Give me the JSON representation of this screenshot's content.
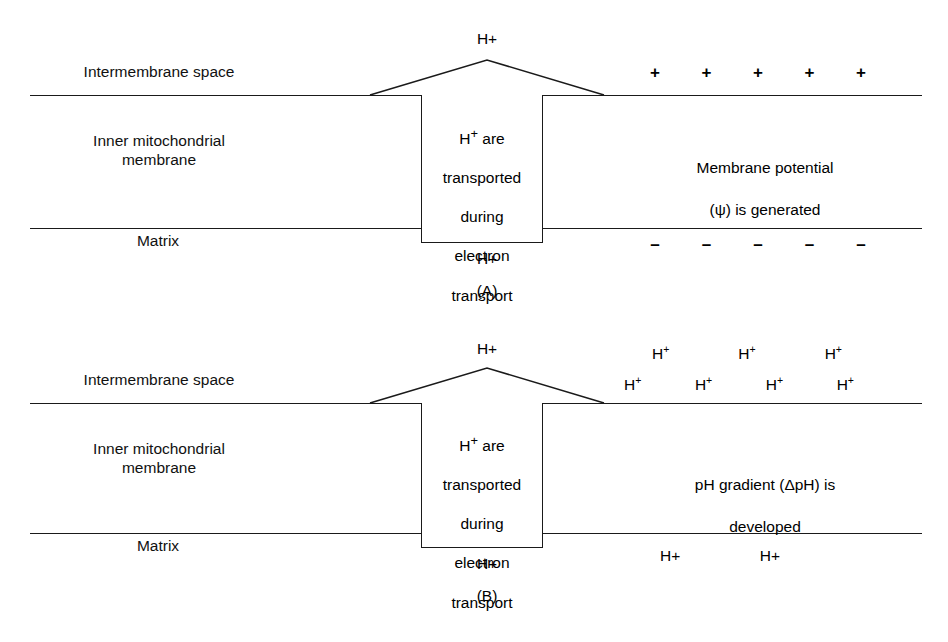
{
  "figure": {
    "type": "biology-diagram"
  },
  "regions": {
    "intermembrane_space": "Intermembrane space",
    "inner_membrane": "Inner mitochondrial\nmembrane",
    "matrix": "Matrix"
  },
  "channel": {
    "text": "H⁺ are\ntransported\nduring\nelectron\ntransport",
    "line1_prefix": "H",
    "line1_sup": "+",
    "line1_suffix": " are",
    "line2": "transported",
    "line3": "during",
    "line4": "electron",
    "line5": "transport"
  },
  "panel_a": {
    "caption": "(A)",
    "proton_top": "H+",
    "proton_bottom": "H+",
    "side_text": "Membrane potential\n(ψ) is generated",
    "side_text_line1": "Membrane potential",
    "side_text_line2": "(ψ) is generated",
    "positive_charges": [
      "+",
      "+",
      "+",
      "+",
      "+"
    ],
    "negative_charges": [
      "–",
      "–",
      "–",
      "–",
      "–"
    ],
    "positive_count": 5,
    "negative_count": 5
  },
  "panel_b": {
    "caption": "(B)",
    "proton_top": "H+",
    "proton_bottom": "H+",
    "side_text": "pH gradient (ΔpH) is\ndeveloped",
    "side_text_line1": "pH gradient (ΔpH) is",
    "side_text_line2": "developed",
    "ion_label": "H",
    "ion_sup": "+",
    "ims_row_top": [
      "H⁺",
      "H⁺",
      "H⁺"
    ],
    "ims_row_bottom": [
      "H⁺",
      "H⁺",
      "H⁺",
      "H⁺"
    ],
    "ims_row_top_count": 3,
    "ims_row_bottom_count": 4,
    "matrix_protons": [
      "H+",
      "H+"
    ],
    "matrix_proton_count": 2
  },
  "colors": {
    "ink": "#1a1a1a",
    "background": "#ffffff"
  }
}
